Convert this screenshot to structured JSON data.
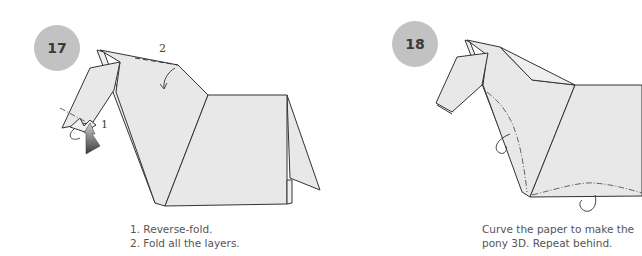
{
  "steps": [
    {
      "number": "17",
      "fold_labels": [
        "1",
        "2"
      ],
      "instructions": [
        "1. Reverse-fold.",
        "2. Fold all the layers."
      ]
    },
    {
      "number": "18",
      "instructions": [
        "Curve the paper to make the",
        "pony 3D. Repeat behind."
      ]
    }
  ],
  "colors": {
    "badge": "#c2c2c2",
    "paper": "#e8e8e8",
    "line": "#333333"
  }
}
